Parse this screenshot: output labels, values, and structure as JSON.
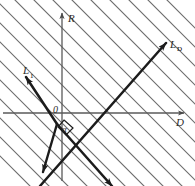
{
  "figure": {
    "background_color": "#ffffff",
    "axis_color": "#4a4a4a",
    "hatch_color": "#6e6e6e",
    "bold_line_color": "#1c1c1c",
    "text_color": "#2b2b2b"
  },
  "axes": {
    "vertical": {
      "name": "R-axis",
      "label": "R"
    },
    "horizontal": {
      "name": "D-axis",
      "label": "D"
    },
    "origin": {
      "label": "0"
    }
  },
  "lines": [
    {
      "id": "LD",
      "label_base": "L",
      "label_sub": "D",
      "direction": "lower-left to upper-right",
      "slope": 1,
      "arrowheads": [
        "upper-right",
        "lower-left"
      ]
    },
    {
      "id": "L1",
      "label_base": "L",
      "label_sub": "1",
      "direction": "upper-left to lower-right",
      "slope": -1,
      "arrowheads": [
        "upper-left",
        "lower-right"
      ]
    }
  ],
  "annotations": {
    "angle": {
      "label": "α",
      "description": "angle between L1 and L D at origin"
    }
  },
  "hatching": {
    "pattern": "parallel diagonal lines",
    "orientation": "upper-left to lower-right",
    "slope": -1,
    "spacing_px": 19,
    "count": 18
  }
}
